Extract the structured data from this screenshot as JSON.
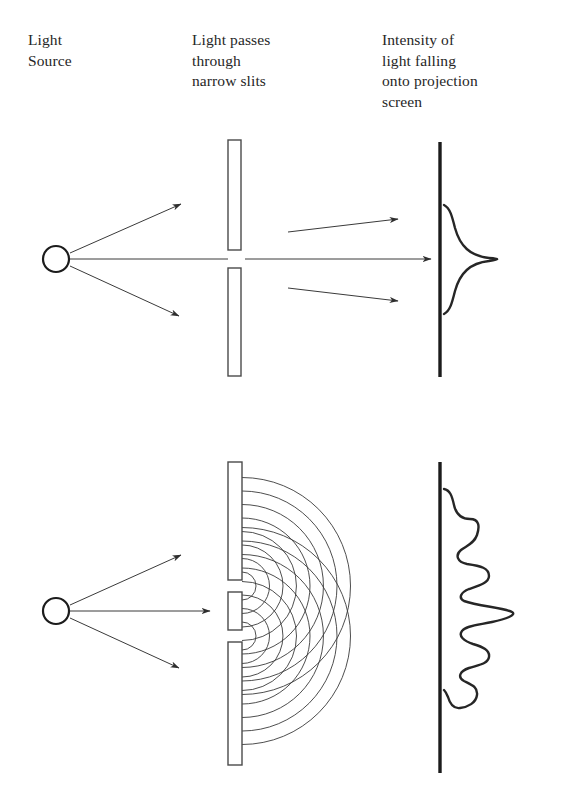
{
  "figure": {
    "background_color": "#ffffff",
    "ink_color": "#262626",
    "captions": {
      "light_source": "Light\nSource",
      "slits": "Light passes\nthrough\nnarrow slits",
      "intensity": "Intensity of\nlight falling\nonto projection\nscreen"
    },
    "panels": [
      {
        "name": "single-slit-panel",
        "label": "top",
        "source": {
          "cx": 56,
          "cy": 259,
          "r": 13
        },
        "rays": [
          {
            "name": "ray-up",
            "x1": 70,
            "y1": 253,
            "x2": 181,
            "y2": 204,
            "arrow": true
          },
          {
            "name": "ray-center",
            "x1": 70,
            "y1": 259,
            "x2": 218,
            "y2": 259,
            "arrow": false
          },
          {
            "name": "ray-down",
            "x1": 70,
            "y1": 266,
            "x2": 179,
            "y2": 316,
            "arrow": true
          }
        ],
        "barrier_bars": [
          {
            "name": "barrier-top",
            "x": 228,
            "y": 140,
            "w": 13,
            "h": 110
          },
          {
            "name": "barrier-bottom",
            "x": 228,
            "y": 268,
            "w": 13,
            "h": 108
          }
        ],
        "slit_openings": [
          {
            "name": "slit-center",
            "cy": 259,
            "gap": 18
          }
        ],
        "exit_rays": [
          {
            "name": "exit-ray-up",
            "x1": 290,
            "y1": 232,
            "x2": 398,
            "y2": 219,
            "arrow": true
          },
          {
            "name": "exit-ray-center",
            "x1": 248,
            "y1": 259,
            "x2": 431,
            "y2": 259,
            "arrow": true
          },
          {
            "name": "exit-ray-down",
            "x1": 290,
            "y1": 288,
            "x2": 398,
            "y2": 301,
            "arrow": true
          }
        ],
        "screen": {
          "x": 440,
          "y1": 142,
          "y2": 377
        },
        "intensity_profile": {
          "type": "single-peak-gaussian",
          "peak_count": 1,
          "peak_center_y": 259,
          "peak_amplitude_px": 56,
          "span_y": [
            205,
            313
          ]
        }
      },
      {
        "name": "double-slit-panel",
        "label": "bottom",
        "source": {
          "cx": 56,
          "cy": 611,
          "r": 13
        },
        "rays": [
          {
            "name": "ray-up",
            "x1": 70,
            "y1": 605,
            "x2": 181,
            "y2": 555,
            "arrow": true
          },
          {
            "name": "ray-center",
            "x1": 70,
            "y1": 611,
            "x2": 210,
            "y2": 611,
            "arrow": true
          },
          {
            "name": "ray-down",
            "x1": 70,
            "y1": 618,
            "x2": 179,
            "y2": 668,
            "arrow": true
          }
        ],
        "barrier_bars": [
          {
            "name": "barrier-top",
            "x": 228,
            "y": 462,
            "w": 14,
            "h": 118
          },
          {
            "name": "barrier-middle",
            "x": 228,
            "y": 592,
            "w": 14,
            "h": 38
          },
          {
            "name": "barrier-bottom",
            "x": 228,
            "y": 642,
            "w": 14,
            "h": 123
          }
        ],
        "slit_openings": [
          {
            "name": "slit-upper",
            "cy": 586,
            "gap": 12
          },
          {
            "name": "slit-lower",
            "cy": 636,
            "gap": 12
          }
        ],
        "wavefronts": {
          "description": "concentric semicircular wavefronts radiating right from each slit",
          "arc_count_per_slit": 8,
          "radius_start": 14,
          "radius_step": 13.5
        },
        "screen": {
          "x": 440,
          "y1": 462,
          "y2": 773
        },
        "intensity_profile": {
          "type": "interference-fringes",
          "peak_count": 5,
          "peak_centers_y": [
            518,
            560,
            607,
            652,
            690
          ],
          "peak_amplitudes_px": [
            28,
            43,
            70,
            43,
            28
          ],
          "span_y": [
            489,
            697
          ]
        }
      }
    ]
  }
}
